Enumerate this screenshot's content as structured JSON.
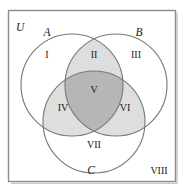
{
  "figure": {
    "type": "venn-diagram",
    "sets": 3,
    "universe_label": "U",
    "background_color": "#ffffff",
    "border_color": "#8c8c8c",
    "circle_stroke_color": "#7a7a7a",
    "shade_pair_color": "#dedede",
    "shade_triple_color": "#b6b6b6",
    "text_color": "#1a1a1a"
  },
  "set_labels": [
    {
      "name": "A",
      "text": "A",
      "x": 47,
      "y": 36
    },
    {
      "name": "B",
      "text": "B",
      "x": 139,
      "y": 36
    },
    {
      "name": "C",
      "text": "C",
      "x": 91,
      "y": 174
    }
  ],
  "regions": [
    {
      "id": "I",
      "text": "I",
      "x": 47,
      "y": 58,
      "desc": "A only",
      "shade": "none"
    },
    {
      "id": "II",
      "text": "II",
      "x": 94,
      "y": 58,
      "desc": "A and B only",
      "shade": "pair"
    },
    {
      "id": "III",
      "text": "III",
      "x": 136,
      "y": 58,
      "desc": "B only",
      "shade": "none"
    },
    {
      "id": "IV",
      "text": "IV",
      "x": 63,
      "y": 111,
      "desc": "A and C only",
      "shade": "pair"
    },
    {
      "id": "V",
      "text": "V",
      "x": 94,
      "y": 93,
      "desc": "A, B and C",
      "shade": "triple"
    },
    {
      "id": "VI",
      "text": "VI",
      "x": 125,
      "y": 111,
      "desc": "B and C only",
      "shade": "pair"
    },
    {
      "id": "VII",
      "text": "VII",
      "x": 94,
      "y": 148,
      "desc": "C only",
      "shade": "none"
    },
    {
      "id": "VIII",
      "text": "VIII",
      "x": 159,
      "y": 174,
      "desc": "outside all",
      "shade": "none"
    }
  ],
  "geometry": {
    "box": {
      "x": 8,
      "y": 10,
      "width": 168,
      "height": 172
    },
    "circles": [
      {
        "name": "A",
        "cx": 72,
        "cy": 85,
        "r": 51
      },
      {
        "name": "B",
        "cx": 116,
        "cy": 85,
        "r": 51
      },
      {
        "name": "C",
        "cx": 94,
        "cy": 122,
        "r": 51
      }
    ]
  }
}
